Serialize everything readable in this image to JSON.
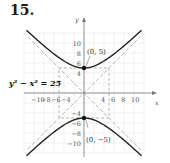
{
  "problem_number": "15.",
  "chart_data": {
    "type": "line",
    "title": "",
    "equation": "y² − x² = 25",
    "xlabel": "x",
    "ylabel": "y",
    "x_ticks": [
      "−10",
      "−8",
      "−6",
      "−4",
      "4",
      "6",
      "8",
      "10"
    ],
    "y_ticks": [
      "10",
      "8",
      "6",
      "4",
      "−4",
      "−6",
      "−8",
      "−10"
    ],
    "xlim": [
      -12,
      12
    ],
    "ylim": [
      -12,
      12
    ],
    "grid": true,
    "series": [
      {
        "name": "upper branch",
        "function": "y = sqrt(25 + x^2)",
        "style": "solid"
      },
      {
        "name": "lower branch",
        "function": "y = -sqrt(25 + x^2)",
        "style": "solid"
      },
      {
        "name": "asymptote y = x",
        "style": "dashed"
      },
      {
        "name": "asymptote y = -x",
        "style": "dashed"
      }
    ],
    "fundamental_rectangle": {
      "x": [
        -5,
        5
      ],
      "y": [
        -5,
        5
      ],
      "style": "dashed"
    },
    "points": [
      {
        "label": "(0, 5)",
        "x": 0,
        "y": 5
      },
      {
        "label": "(0, −5)",
        "x": 0,
        "y": -5
      }
    ]
  },
  "labels": {
    "equation": "y² − x² = 25",
    "vertex_top": "(0, 5)",
    "vertex_bottom": "(0, −5)",
    "x_axis": "x",
    "y_axis": "y"
  }
}
